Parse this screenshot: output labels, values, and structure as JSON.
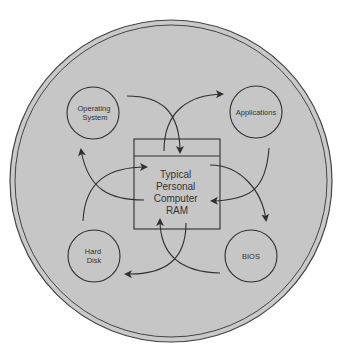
{
  "diagram": {
    "title": "",
    "center": {
      "lines": [
        "Typical",
        "Personal",
        "Computer",
        "RAM"
      ]
    },
    "nodes": [
      {
        "id": "os",
        "lines": [
          "Operating",
          "System"
        ]
      },
      {
        "id": "apps",
        "lines": [
          "Applications"
        ]
      },
      {
        "id": "disk",
        "lines": [
          "Hard",
          "Disk"
        ]
      },
      {
        "id": "bios",
        "lines": [
          "BIOS"
        ]
      }
    ],
    "edges": [
      {
        "from": "os",
        "to": "ram"
      },
      {
        "from": "ram",
        "to": "apps"
      },
      {
        "from": "apps",
        "to": "ram"
      },
      {
        "from": "ram",
        "to": "bios"
      },
      {
        "from": "bios",
        "to": "ram"
      },
      {
        "from": "ram",
        "to": "disk"
      },
      {
        "from": "disk",
        "to": "ram"
      },
      {
        "from": "ram",
        "to": "os"
      }
    ],
    "colors": {
      "background": "#c9c9c9",
      "stroke": "#2f2f2f",
      "text": "#333333"
    }
  }
}
